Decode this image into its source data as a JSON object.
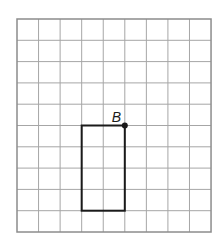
{
  "grid": {
    "columns": 9,
    "rows": 10,
    "origin_x": 17,
    "origin_y": 19,
    "cell_w": 21.56,
    "cell_h": 21.3,
    "line_color": "#a6a6a6",
    "border_color": "#8c8c8c"
  },
  "rectangle": {
    "col_start": 3,
    "row_start": 5,
    "col_end": 5,
    "row_end": 9,
    "stroke": "#1a1a1a"
  },
  "point": {
    "label": "B",
    "col": 5,
    "row": 5,
    "color": "#1a1a1a"
  }
}
